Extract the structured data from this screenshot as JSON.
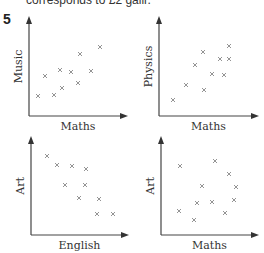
{
  "header": {
    "top_text": "corresponds to £2 gallr.",
    "question_number": "5"
  },
  "chart_data": [
    {
      "type": "scatter",
      "title": "",
      "xlabel": "Maths",
      "ylabel": "Music",
      "grid": false,
      "marker": "x",
      "correlation": "positive",
      "points": [
        [
          38,
          96
        ],
        [
          45,
          76
        ],
        [
          54,
          95
        ],
        [
          60,
          70
        ],
        [
          62,
          88
        ],
        [
          71,
          72
        ],
        [
          78,
          83
        ],
        [
          80,
          54
        ],
        [
          91,
          71
        ],
        [
          100,
          47
        ]
      ],
      "axes": {
        "origin": [
          29,
          116
        ],
        "x_end": 127,
        "y_end": 17
      }
    },
    {
      "type": "scatter",
      "title": "",
      "xlabel": "Maths",
      "ylabel": "Physics",
      "grid": false,
      "marker": "x",
      "correlation": "positive",
      "points": [
        [
          173,
          100
        ],
        [
          186,
          85
        ],
        [
          195,
          65
        ],
        [
          203,
          52
        ],
        [
          204,
          90
        ],
        [
          212,
          74
        ],
        [
          220,
          59
        ],
        [
          224,
          75
        ],
        [
          229,
          59
        ],
        [
          229,
          46
        ]
      ],
      "axes": {
        "origin": [
          159,
          116
        ],
        "x_end": 258,
        "y_end": 17
      }
    },
    {
      "type": "scatter",
      "title": "",
      "xlabel": "English",
      "ylabel": "Art",
      "grid": false,
      "marker": "x",
      "correlation": "negative",
      "points": [
        [
          47,
          156
        ],
        [
          57,
          165
        ],
        [
          72,
          166
        ],
        [
          86,
          169
        ],
        [
          65,
          185
        ],
        [
          85,
          185
        ],
        [
          79,
          198
        ],
        [
          99,
          199
        ],
        [
          97,
          214
        ],
        [
          113,
          214
        ]
      ],
      "axes": {
        "origin": [
          31,
          235
        ],
        "x_end": 128,
        "y_end": 137
      }
    },
    {
      "type": "scatter",
      "title": "",
      "xlabel": "Maths",
      "ylabel": "Art",
      "grid": false,
      "marker": "x",
      "correlation": "none",
      "points": [
        [
          180,
          166
        ],
        [
          215,
          161
        ],
        [
          229,
          174
        ],
        [
          202,
          186
        ],
        [
          236,
          187
        ],
        [
          197,
          203
        ],
        [
          212,
          202
        ],
        [
          234,
          200
        ],
        [
          179,
          211
        ],
        [
          194,
          220
        ],
        [
          225,
          213
        ]
      ],
      "axes": {
        "origin": [
          161,
          235
        ],
        "x_end": 258,
        "y_end": 137
      }
    }
  ]
}
